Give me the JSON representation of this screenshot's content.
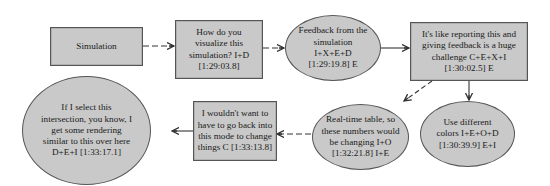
{
  "diagram": {
    "style": {
      "fill": "#c9c9c9",
      "stroke": "#555555",
      "text": "#1a1a1a",
      "edge": "#333333"
    },
    "nodes": [
      {
        "id": "n1",
        "shape": "rect",
        "label": "Simulation"
      },
      {
        "id": "n2",
        "shape": "rect",
        "label": "How do you visualize this simulation? I+D [1:29:03.8]"
      },
      {
        "id": "n3",
        "shape": "ellipse",
        "label": "Feedback from the simulation I+X+E+D [1:29:19.8] E"
      },
      {
        "id": "n4",
        "shape": "rect",
        "label": "It's like reporting this and giving feedback is a huge challenge C+E+X+I [1:30:02.5] E"
      },
      {
        "id": "n5",
        "shape": "ellipse",
        "label": "Use different colors I+E+O+D [1:30:39.9] E+I"
      },
      {
        "id": "n6",
        "shape": "ellipse",
        "label": "Real-time table, so these numbers would be changing I+O [1:32:21.8] I+E"
      },
      {
        "id": "n7",
        "shape": "rect",
        "label": "I wouldn't want to have to go back into this mode to change things C [1:33:13.8]"
      },
      {
        "id": "n8",
        "shape": "ellipse",
        "label": "If I select this intersection, you know, I get some rendering similar to this over here D+E+I [1:33:17.1]"
      }
    ],
    "edges": [
      {
        "from": "n1",
        "to": "n2",
        "style": "dashed"
      },
      {
        "from": "n2",
        "to": "n3",
        "style": "dashed"
      },
      {
        "from": "n3",
        "to": "n4",
        "style": "solid"
      },
      {
        "from": "n4",
        "to": "n6",
        "style": "dashed"
      },
      {
        "from": "n4",
        "to": "n5",
        "style": "solid"
      },
      {
        "from": "n6",
        "to": "n7",
        "style": "dashed"
      },
      {
        "from": "n7",
        "to": "n8",
        "style": "solid"
      }
    ]
  }
}
